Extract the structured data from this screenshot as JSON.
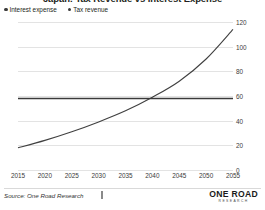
{
  "chart_data": {
    "type": "line",
    "title": "Japan: Tax Revenue vs Interest Expense",
    "xlabel": "",
    "ylabel": "",
    "xlim": [
      2015,
      2055
    ],
    "ylim": [
      0,
      120
    ],
    "grid": true,
    "legend_position": "top-left",
    "x_ticks": [
      "2015",
      "2020",
      "2025",
      "2030",
      "2035",
      "2040",
      "2045",
      "2050",
      "2055"
    ],
    "y_ticks": [
      "0",
      "20",
      "40",
      "60",
      "80",
      "100",
      "120"
    ],
    "x": [
      2015,
      2020,
      2025,
      2030,
      2035,
      2040,
      2045,
      2050,
      2055
    ],
    "series": [
      {
        "name": "Interest expense",
        "color": "#404040",
        "values": [
          18,
          24,
          31,
          39,
          48,
          59,
          72,
          90,
          114
        ]
      },
      {
        "name": "Tax revenue",
        "color": "#3a3a3a",
        "values": [
          58,
          58,
          58,
          58,
          58,
          58,
          58,
          58,
          58
        ]
      }
    ]
  },
  "legend": {
    "items": [
      {
        "label": "Interest expense",
        "swatch": "legend-dot-icon"
      },
      {
        "label": "Tax revenue",
        "swatch": "legend-dot-icon"
      }
    ]
  },
  "footer": {
    "source": "Source: One Road Research",
    "brand_name": "ONE ROAD",
    "brand_sub": "RESEARCH"
  },
  "colors": {
    "ink": "#231f20",
    "grid": "#e3e3e3",
    "interest_expense": "#404040",
    "tax_revenue": "#3a3a3a"
  }
}
